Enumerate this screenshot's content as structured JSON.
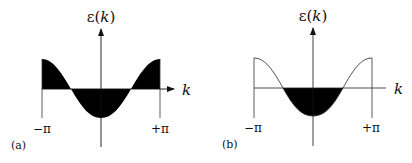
{
  "figure": {
    "panels": [
      {
        "id": "a",
        "label": "(a)",
        "y_axis_label": "ε(k)",
        "x_axis_label": "k",
        "tick_left": "−π",
        "tick_right": "+π",
        "description": "Full band filled: entire region between ε(k) and the k-axis shaded black over −π to +π",
        "fill_color": "#000000"
      },
      {
        "id": "b",
        "label": "(b)",
        "y_axis_label": "ε(k)",
        "x_axis_label": "k",
        "tick_left": "−π",
        "tick_right": "+π",
        "description": "Partially filled band: only the region below the k-axis (ε<0, near k=0) shaded black",
        "fill_color": "#000000"
      }
    ],
    "curve": "ε(k) = −cos(k), plotted from k=−π to k=+π"
  }
}
